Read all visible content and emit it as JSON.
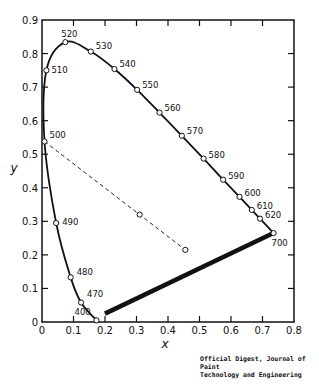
{
  "chart_data": {
    "type": "line",
    "title": "",
    "xlabel": "x",
    "ylabel": "y",
    "xlim": [
      0,
      0.8
    ],
    "ylim": [
      0,
      0.9
    ],
    "grid": false,
    "xticks": [
      "0",
      "0.1",
      "0.2",
      "0.3",
      "0.4",
      "0.5",
      "0.6",
      "0.7",
      "0.8"
    ],
    "yticks": [
      "0",
      "0.1",
      "0.2",
      "0.3",
      "0.4",
      "0.5",
      "0.6",
      "0.7",
      "0.8",
      "0.9"
    ],
    "series": [
      {
        "name": "spectrum locus",
        "style": "solid",
        "points": [
          {
            "wl": "400",
            "x": 0.173,
            "y": 0.005
          },
          {
            "wl": "470",
            "x": 0.124,
            "y": 0.058
          },
          {
            "wl": "480",
            "x": 0.091,
            "y": 0.133
          },
          {
            "wl": "490",
            "x": 0.045,
            "y": 0.295
          },
          {
            "wl": "500",
            "x": 0.008,
            "y": 0.538
          },
          {
            "wl": "510",
            "x": 0.014,
            "y": 0.75
          },
          {
            "wl": "520",
            "x": 0.074,
            "y": 0.834
          },
          {
            "wl": "530",
            "x": 0.155,
            "y": 0.806
          },
          {
            "wl": "540",
            "x": 0.23,
            "y": 0.754
          },
          {
            "wl": "550",
            "x": 0.302,
            "y": 0.692
          },
          {
            "wl": "560",
            "x": 0.373,
            "y": 0.624
          },
          {
            "wl": "570",
            "x": 0.444,
            "y": 0.555
          },
          {
            "wl": "580",
            "x": 0.513,
            "y": 0.487
          },
          {
            "wl": "590",
            "x": 0.575,
            "y": 0.424
          },
          {
            "wl": "600",
            "x": 0.627,
            "y": 0.373
          },
          {
            "wl": "610",
            "x": 0.666,
            "y": 0.334
          },
          {
            "wl": "620",
            "x": 0.692,
            "y": 0.308
          },
          {
            "wl": "700",
            "x": 0.735,
            "y": 0.265
          }
        ]
      },
      {
        "name": "purple line",
        "style": "thick",
        "points": [
          {
            "x": 0.2,
            "y": 0.025
          },
          {
            "x": 0.735,
            "y": 0.265
          }
        ]
      },
      {
        "name": "dominant wavelength line",
        "style": "dashed",
        "points": [
          {
            "x": 0.008,
            "y": 0.538
          },
          {
            "x": 0.31,
            "y": 0.32
          },
          {
            "x": 0.455,
            "y": 0.215
          }
        ]
      }
    ]
  },
  "credit": {
    "line1": "Official Digest, Journal of Paint",
    "line2": "Technology and Engineering"
  }
}
